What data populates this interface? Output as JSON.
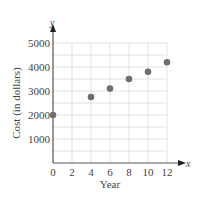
{
  "chart_data": {
    "type": "scatter",
    "title": "",
    "xlabel": "Year",
    "ylabel": "Cost (in dollars)",
    "x_axis_name": "x",
    "y_axis_name": "y",
    "xlim": [
      0,
      12
    ],
    "ylim": [
      0,
      5000
    ],
    "xticks": [
      0,
      2,
      4,
      6,
      8,
      10,
      12
    ],
    "yticks": [
      1000,
      2000,
      3000,
      4000,
      5000
    ],
    "grid": true,
    "grid_minor_y_step": 500,
    "grid_x_step": 2,
    "legend": null,
    "points": [
      {
        "x": 0,
        "y": 2000
      },
      {
        "x": 4,
        "y": 2750
      },
      {
        "x": 6,
        "y": 3100
      },
      {
        "x": 8,
        "y": 3500
      },
      {
        "x": 10,
        "y": 3800
      },
      {
        "x": 12,
        "y": 4200
      }
    ],
    "colors": {
      "point": "#6e6e6e",
      "axis": "#555555",
      "grid": "#dcdcdc"
    }
  }
}
